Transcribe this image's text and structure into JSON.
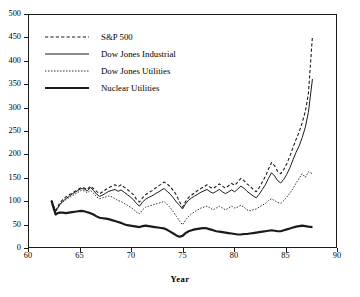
{
  "chart_data": {
    "type": "line",
    "title": "",
    "subtitle": "",
    "xlabel": "Year",
    "ylabel": "",
    "xlim": [
      60,
      90
    ],
    "ylim": [
      0,
      500
    ],
    "xticks": [
      60,
      65,
      70,
      75,
      80,
      85,
      90
    ],
    "yticks": [
      0,
      50,
      100,
      150,
      200,
      250,
      300,
      350,
      400,
      450,
      500
    ],
    "xtick_labels": [
      "60",
      "65",
      "70",
      "75",
      "80",
      "85",
      "90"
    ],
    "ytick_labels": [
      "0",
      "50",
      "100",
      "150",
      "200",
      "250",
      "300",
      "350",
      "400",
      "450",
      "500"
    ],
    "grid": false,
    "legend_position": "upper left",
    "note": "All series indexed to 100 at start (1962.2). Values read off the y-axis.",
    "series": [
      {
        "name": "S&P 500",
        "style": "dashed",
        "color": "#1a1a1a",
        "width": 1.1,
        "x": [
          62.2,
          62.4,
          62.6,
          62.8,
          63.0,
          63.3,
          63.6,
          63.9,
          64.2,
          64.5,
          64.8,
          65.1,
          65.4,
          65.7,
          66.0,
          66.3,
          66.6,
          66.9,
          67.2,
          67.5,
          67.8,
          68.1,
          68.4,
          68.7,
          69.0,
          69.3,
          69.6,
          69.9,
          70.2,
          70.5,
          70.8,
          71.1,
          71.4,
          71.7,
          72.0,
          72.3,
          72.6,
          72.9,
          73.2,
          73.5,
          73.8,
          74.1,
          74.4,
          74.7,
          75.0,
          75.3,
          75.6,
          75.9,
          76.2,
          76.5,
          76.8,
          77.1,
          77.4,
          77.7,
          78.0,
          78.3,
          78.6,
          78.9,
          79.2,
          79.5,
          79.8,
          80.1,
          80.4,
          80.7,
          81.0,
          81.3,
          81.6,
          81.9,
          82.2,
          82.5,
          82.8,
          83.1,
          83.4,
          83.7,
          84.0,
          84.3,
          84.6,
          84.9,
          85.2,
          85.5,
          85.8,
          86.1,
          86.4,
          86.7,
          87.0,
          87.3,
          87.7
        ],
        "y": [
          100,
          88,
          78,
          86,
          95,
          102,
          108,
          112,
          116,
          120,
          124,
          128,
          127,
          124,
          131,
          126,
          120,
          115,
          119,
          124,
          128,
          131,
          134,
          130,
          134,
          129,
          124,
          119,
          113,
          103,
          97,
          106,
          113,
          117,
          121,
          126,
          131,
          135,
          140,
          136,
          130,
          122,
          112,
          98,
          86,
          98,
          107,
          112,
          117,
          122,
          126,
          130,
          134,
          129,
          126,
          131,
          136,
          131,
          127,
          132,
          137,
          133,
          140,
          148,
          143,
          136,
          131,
          124,
          119,
          128,
          140,
          152,
          168,
          182,
          175,
          163,
          158,
          167,
          180,
          196,
          215,
          232,
          248,
          268,
          292,
          330,
          455
        ]
      },
      {
        "name": "Dow Jones Industrial",
        "style": "solid-thin",
        "color": "#1a1a1a",
        "width": 1.0,
        "x": [
          62.2,
          62.4,
          62.6,
          62.8,
          63.0,
          63.3,
          63.6,
          63.9,
          64.2,
          64.5,
          64.8,
          65.1,
          65.4,
          65.7,
          66.0,
          66.3,
          66.6,
          66.9,
          67.2,
          67.5,
          67.8,
          68.1,
          68.4,
          68.7,
          69.0,
          69.3,
          69.6,
          69.9,
          70.2,
          70.5,
          70.8,
          71.1,
          71.4,
          71.7,
          72.0,
          72.3,
          72.6,
          72.9,
          73.2,
          73.5,
          73.8,
          74.1,
          74.4,
          74.7,
          75.0,
          75.3,
          75.6,
          75.9,
          76.2,
          76.5,
          76.8,
          77.1,
          77.4,
          77.7,
          78.0,
          78.3,
          78.6,
          78.9,
          79.2,
          79.5,
          79.8,
          80.1,
          80.4,
          80.7,
          81.0,
          81.3,
          81.6,
          81.9,
          82.2,
          82.5,
          82.8,
          83.1,
          83.4,
          83.7,
          84.0,
          84.3,
          84.6,
          84.9,
          85.2,
          85.5,
          85.8,
          86.1,
          86.4,
          86.7,
          87.0,
          87.3,
          87.7
        ],
        "y": [
          100,
          86,
          76,
          83,
          91,
          98,
          104,
          109,
          114,
          118,
          122,
          126,
          125,
          121,
          128,
          122,
          114,
          109,
          112,
          116,
          120,
          122,
          124,
          120,
          123,
          118,
          113,
          108,
          102,
          94,
          88,
          97,
          103,
          107,
          110,
          114,
          118,
          122,
          126,
          120,
          114,
          106,
          97,
          90,
          82,
          93,
          101,
          106,
          110,
          114,
          118,
          121,
          124,
          119,
          116,
          120,
          124,
          119,
          115,
          119,
          123,
          119,
          125,
          131,
          127,
          120,
          115,
          110,
          106,
          114,
          124,
          134,
          148,
          160,
          153,
          143,
          138,
          146,
          157,
          171,
          188,
          204,
          218,
          236,
          258,
          290,
          362
        ]
      },
      {
        "name": "Dow Jones Utilities",
        "style": "dotted",
        "color": "#1a1a1a",
        "width": 0.9,
        "x": [
          62.2,
          62.4,
          62.6,
          62.8,
          63.0,
          63.3,
          63.6,
          63.9,
          64.2,
          64.5,
          64.8,
          65.1,
          65.4,
          65.7,
          66.0,
          66.3,
          66.6,
          66.9,
          67.2,
          67.5,
          67.8,
          68.1,
          68.4,
          68.7,
          69.0,
          69.3,
          69.6,
          69.9,
          70.2,
          70.5,
          70.8,
          71.1,
          71.4,
          71.7,
          72.0,
          72.3,
          72.6,
          72.9,
          73.2,
          73.5,
          73.8,
          74.1,
          74.4,
          74.7,
          75.0,
          75.3,
          75.6,
          75.9,
          76.2,
          76.5,
          76.8,
          77.1,
          77.4,
          77.7,
          78.0,
          78.3,
          78.6,
          78.9,
          79.2,
          79.5,
          79.8,
          80.1,
          80.4,
          80.7,
          81.0,
          81.3,
          81.6,
          81.9,
          82.2,
          82.5,
          82.8,
          83.1,
          83.4,
          83.7,
          84.0,
          84.3,
          84.6,
          84.9,
          85.2,
          85.5,
          85.8,
          86.1,
          86.4,
          86.7,
          87.0,
          87.3,
          87.7
        ],
        "y": [
          100,
          90,
          80,
          86,
          92,
          97,
          102,
          106,
          110,
          114,
          118,
          122,
          121,
          117,
          122,
          116,
          108,
          104,
          106,
          108,
          110,
          108,
          104,
          100,
          98,
          94,
          90,
          86,
          82,
          75,
          72,
          80,
          86,
          88,
          90,
          92,
          94,
          96,
          98,
          92,
          85,
          76,
          66,
          56,
          48,
          58,
          66,
          72,
          76,
          80,
          84,
          86,
          88,
          84,
          80,
          84,
          88,
          84,
          80,
          84,
          88,
          84,
          86,
          90,
          86,
          80,
          78,
          80,
          82,
          86,
          90,
          94,
          100,
          104,
          100,
          96,
          94,
          100,
          108,
          116,
          126,
          138,
          148,
          158,
          150,
          162,
          158
        ]
      },
      {
        "name": "Nuclear Utilities",
        "style": "solid-thick",
        "color": "#1a1a1a",
        "width": 2.2,
        "x": [
          62.2,
          62.4,
          62.6,
          62.8,
          63.0,
          63.3,
          63.6,
          63.9,
          64.2,
          64.5,
          64.8,
          65.1,
          65.4,
          65.7,
          66.0,
          66.3,
          66.6,
          66.9,
          67.2,
          67.5,
          67.8,
          68.1,
          68.4,
          68.7,
          69.0,
          69.3,
          69.6,
          69.9,
          70.2,
          70.5,
          70.8,
          71.1,
          71.4,
          71.7,
          72.0,
          72.3,
          72.6,
          72.9,
          73.2,
          73.5,
          73.8,
          74.1,
          74.4,
          74.7,
          75.0,
          75.3,
          75.6,
          75.9,
          76.2,
          76.5,
          76.8,
          77.1,
          77.4,
          77.7,
          78.0,
          78.3,
          78.6,
          78.9,
          79.2,
          79.5,
          79.8,
          80.1,
          80.4,
          80.7,
          81.0,
          81.3,
          81.6,
          81.9,
          82.2,
          82.5,
          82.8,
          83.1,
          83.4,
          83.7,
          84.0,
          84.3,
          84.6,
          84.9,
          85.2,
          85.5,
          85.8,
          86.1,
          86.4,
          86.7,
          87.0,
          87.3,
          87.7
        ],
        "y": [
          100,
          84,
          70,
          73,
          74,
          74,
          73,
          74,
          75,
          76,
          77,
          78,
          77,
          75,
          73,
          70,
          66,
          63,
          62,
          61,
          60,
          58,
          56,
          54,
          52,
          49,
          47,
          46,
          45,
          44,
          43,
          45,
          46,
          45,
          44,
          43,
          42,
          41,
          40,
          37,
          33,
          29,
          25,
          22,
          24,
          30,
          34,
          36,
          38,
          39,
          40,
          41,
          40,
          38,
          36,
          34,
          33,
          32,
          31,
          30,
          29,
          28,
          27,
          27,
          28,
          28,
          29,
          30,
          31,
          32,
          33,
          34,
          35,
          36,
          35,
          34,
          34,
          36,
          38,
          40,
          42,
          44,
          45,
          46,
          45,
          44,
          43
        ]
      }
    ]
  },
  "axes": {
    "x_title": "Year"
  },
  "legend": {
    "items": [
      {
        "label": "S&P 500",
        "style": "dashed"
      },
      {
        "label": "Dow Jones Industrial",
        "style": "solid-thin"
      },
      {
        "label": "Dow Jones Utilities",
        "style": "dotted"
      },
      {
        "label": "Nuclear Utilities",
        "style": "solid-thick"
      }
    ]
  },
  "colors": {
    "ink": "#1a1a1a",
    "background": "#ffffff"
  }
}
